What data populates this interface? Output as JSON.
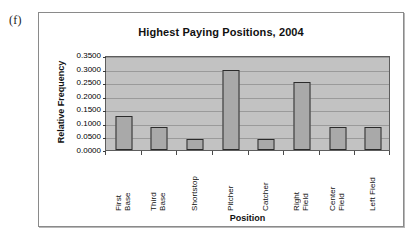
{
  "figure": {
    "letter": "(f)"
  },
  "chart_data": {
    "type": "bar",
    "title": "Highest Paying Positions, 2004",
    "xlabel": "Position",
    "ylabel": "Relative Frequency",
    "categories": [
      "First Base",
      "Third Base",
      "Shortstop",
      "Pitcher",
      "Catcher",
      "Right Field",
      "Center Field",
      "Left Field"
    ],
    "category_lines": [
      [
        "First",
        "Base"
      ],
      [
        "Third",
        "Base"
      ],
      [
        "Shortstop"
      ],
      [
        "Pitcher"
      ],
      [
        "Catcher"
      ],
      [
        "Right",
        "Field"
      ],
      [
        "Center",
        "Field"
      ],
      [
        "Left Field"
      ]
    ],
    "values": [
      0.125,
      0.085,
      0.042,
      0.295,
      0.042,
      0.25,
      0.085,
      0.085
    ],
    "ylim": [
      0.0,
      0.35
    ],
    "ytick_values": [
      0.0,
      0.05,
      0.1,
      0.15,
      0.2,
      0.25,
      0.3,
      0.35
    ],
    "ytick_labels": [
      "0.0000",
      "0.0500",
      "0.1000",
      "0.1500",
      "0.2000",
      "0.2500",
      "0.3000",
      "0.3500"
    ],
    "grid": true,
    "grid_axis": "y",
    "legend": false,
    "bar_color": "#a9a9a9",
    "bar_edge_color": "#2b2b2b",
    "plot_background": "#c2c2c2",
    "gridline_color": "#9a9a9a"
  }
}
